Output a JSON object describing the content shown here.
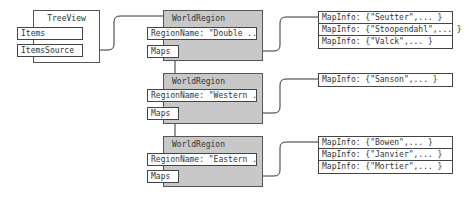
{
  "treeview": {
    "title": "TreeView",
    "items_label": "Items",
    "items_source_label": "ItemsSource"
  },
  "regions": [
    {
      "title": "WorldRegion",
      "region_name": "RegionName: \"Double ...\"",
      "maps_label": "Maps",
      "maps": [
        "MapInfo: {\"Seutter\",... }",
        "MapInfo: {\"Stoopendahl\",... }",
        "MapInfo: {\"Valck\",... }"
      ]
    },
    {
      "title": "WorldRegion",
      "region_name": "RegionName: \"Western ...\"",
      "maps_label": "Maps",
      "maps": [
        "MapInfo: {\"Sanson\",... }"
      ]
    },
    {
      "title": "WorldRegion",
      "region_name": "RegionName: \"Eastern ...\"",
      "maps_label": "Maps",
      "maps": [
        "MapInfo: {\"Bowen\",... }",
        "MapInfo: {\"Janvier\",... }",
        "MapInfo: {\"Mortier\",... }"
      ]
    }
  ],
  "colors": {
    "region_fill": "#c8c8c8",
    "line": "#333333"
  }
}
